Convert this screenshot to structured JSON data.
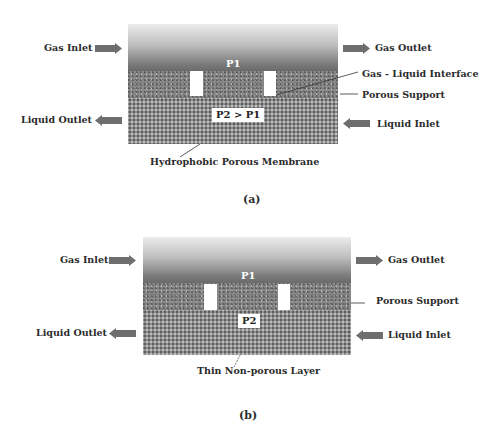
{
  "panels": [
    {
      "id": "a",
      "caption": "(a)",
      "labels": {
        "gas_inlet": "Gas Inlet",
        "gas_outlet": "Gas Outlet",
        "liquid_outlet": "Liquid Outlet",
        "liquid_inlet": "Liquid Inlet",
        "interface": "Gas - Liquid Interface",
        "porous_support": "Porous Support",
        "membrane": "Hydrophobic Porous Membrane",
        "gas_pressure": "P1",
        "liquid_pressure": "P2 > P1"
      }
    },
    {
      "id": "b",
      "caption": "(b)",
      "labels": {
        "gas_inlet": "Gas Inlet",
        "gas_outlet": "Gas Outlet",
        "liquid_outlet": "Liquid Outlet",
        "liquid_inlet": "Liquid Inlet",
        "porous_support": "Porous Support",
        "membrane": "Thin Non-porous Layer",
        "gas_pressure": "P1",
        "liquid_pressure": "P2"
      }
    }
  ],
  "colors": {
    "arrow": "#6e6e6e",
    "text": "#2b2b2b",
    "pore": "#ffffff"
  },
  "icons": {
    "flow_right": "arrow-right-icon",
    "flow_left": "arrow-left-icon"
  }
}
